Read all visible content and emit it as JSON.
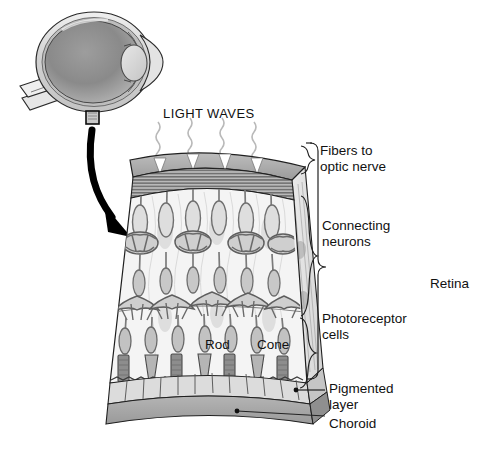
{
  "figure": {
    "title_visible": false,
    "background_color": "#ffffff"
  },
  "eye_inset": {
    "name": "eye-cross-section",
    "description_visible": false,
    "callout_box_visible": true,
    "arrow_visible": true
  },
  "light": {
    "label": "LIGHT WAVES",
    "wave_count": 4,
    "arrowhead_count": 4,
    "arrow_color": "#ffffff"
  },
  "cell_labels": {
    "rod": "Rod",
    "cone": "Cone"
  },
  "layer_labels": [
    {
      "id": "fibers",
      "line1": "Fibers to",
      "line2": "optic nerve"
    },
    {
      "id": "connecting",
      "line1": "Connecting",
      "line2": "neurons"
    },
    {
      "id": "photoreceptor",
      "line1": "Photoreceptor",
      "line2": "cells"
    },
    {
      "id": "pigmented",
      "line1": "Pigmented",
      "line2": "layer"
    },
    {
      "id": "choroid",
      "line1": "Choroid",
      "line2": ""
    }
  ],
  "bracket_labels": {
    "retina": "Retina"
  },
  "colors": {
    "outline": "#1a1a1a",
    "leader": "#222222",
    "top_face": "#a8a8a8",
    "fiber_band": "#8f8f8f",
    "front_face": "#f2f2f2",
    "side_face": "#e2e2e2",
    "pigment_cells": "#d9d9d9",
    "choroid": "#a9a9a9",
    "neuron_ink": "#6e6e6e",
    "sclera": "#d6d6d6",
    "vitreous": "#8c8c8c",
    "lens": "#d0d0d0"
  }
}
